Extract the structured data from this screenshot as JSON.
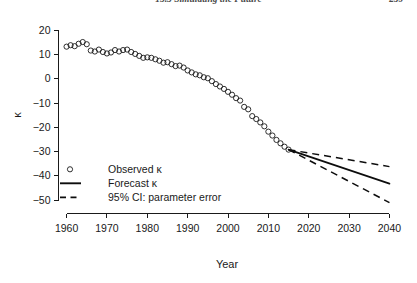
{
  "running_head": {
    "title": "15.3  Simulating the Future",
    "page_number": "259"
  },
  "chart_data": {
    "type": "line",
    "title": "",
    "subtitle": "",
    "xlabel": "Year",
    "ylabel": "κ",
    "xlim": [
      1958,
      2040
    ],
    "ylim": [
      -55,
      22
    ],
    "xticks": [
      1960,
      1970,
      1980,
      1990,
      2000,
      2010,
      2020,
      2030,
      2040
    ],
    "xticklabels": [
      "1960",
      "1970",
      "1980",
      "1990",
      "2000",
      "2010",
      "2020",
      "2030",
      "2040"
    ],
    "yticks": [
      20,
      10,
      0,
      -10,
      -20,
      -30,
      -40,
      -50
    ],
    "yticklabels": [
      "20",
      "10",
      "0",
      "−10",
      "−20",
      "−30",
      "−40",
      "−50"
    ],
    "grid": false,
    "legend_position": "lower left",
    "legend": [
      {
        "label": "Observed κ",
        "marker": "open-circle",
        "linestyle": "none"
      },
      {
        "label": "Forecast κ",
        "marker": "none",
        "linestyle": "solid"
      },
      {
        "label": "95% CI: parameter error",
        "marker": "none",
        "linestyle": "dashed"
      }
    ],
    "series": [
      {
        "name": "Observed κ",
        "style": "open-circle-markers",
        "x": [
          1960,
          1961,
          1962,
          1963,
          1964,
          1965,
          1966,
          1967,
          1968,
          1969,
          1970,
          1971,
          1972,
          1973,
          1974,
          1975,
          1976,
          1977,
          1978,
          1979,
          1980,
          1981,
          1982,
          1983,
          1984,
          1985,
          1986,
          1987,
          1988,
          1989,
          1990,
          1991,
          1992,
          1993,
          1994,
          1995,
          1996,
          1997,
          1998,
          1999,
          2000,
          2001,
          2002,
          2003,
          2004,
          2005,
          2006,
          2007,
          2008,
          2009,
          2010,
          2011,
          2012,
          2013,
          2014,
          2015
        ],
        "values": [
          13.2,
          13.8,
          13.4,
          14.4,
          15.1,
          14.2,
          11.6,
          11.2,
          12.0,
          11.0,
          10.4,
          10.8,
          11.8,
          11.2,
          11.8,
          12.0,
          11.0,
          10.2,
          9.4,
          8.6,
          8.8,
          8.6,
          8.0,
          7.4,
          6.6,
          6.8,
          6.0,
          5.2,
          5.4,
          4.6,
          3.4,
          2.6,
          1.8,
          1.4,
          0.6,
          0.2,
          -1.0,
          -2.2,
          -3.2,
          -4.2,
          -5.4,
          -6.6,
          -8.0,
          -9.0,
          -11.6,
          -12.6,
          -15.4,
          -16.6,
          -18.0,
          -19.6,
          -21.8,
          -23.4,
          -25.2,
          -26.6,
          -28.0,
          -29.2
        ]
      },
      {
        "name": "Forecast κ",
        "style": "solid-line",
        "x": [
          2015,
          2040
        ],
        "values": [
          -29.2,
          -43.2
        ]
      },
      {
        "name": "95% CI upper",
        "style": "dashed-line",
        "x": [
          2015,
          2040
        ],
        "values": [
          -29.2,
          -36.2
        ]
      },
      {
        "name": "95% CI lower",
        "style": "dashed-line",
        "x": [
          2015,
          2040
        ],
        "values": [
          -29.2,
          -51.0
        ]
      }
    ]
  }
}
